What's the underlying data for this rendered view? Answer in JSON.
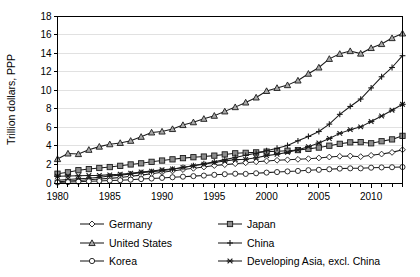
{
  "chart_data": {
    "type": "line",
    "title": "",
    "xlabel": "",
    "ylabel": "Trillion dollars, PPP",
    "xlim": [
      1980,
      2013
    ],
    "ylim": [
      0,
      18
    ],
    "ytick_step": 2,
    "yticks": [
      "0",
      "2",
      "4",
      "6",
      "8",
      "10",
      "12",
      "14",
      "16",
      "18"
    ],
    "xticks": [
      "1980",
      "1985",
      "1990",
      "1995",
      "2000",
      "2005",
      "2010"
    ],
    "xtick_values": [
      1980,
      1985,
      1990,
      1995,
      2000,
      2005,
      2010
    ],
    "minor_xticks_every": 1,
    "grid": "horizontal",
    "grid_color": "#d9d9d9",
    "legend_position": "bottom",
    "legend_columns": 2,
    "x": [
      1980,
      1981,
      1982,
      1983,
      1984,
      1985,
      1986,
      1987,
      1988,
      1989,
      1990,
      1991,
      1992,
      1993,
      1994,
      1995,
      1996,
      1997,
      1998,
      1999,
      2000,
      2001,
      2002,
      2003,
      2004,
      2005,
      2006,
      2007,
      2008,
      2009,
      2010,
      2011,
      2012,
      2013
    ],
    "series": [
      {
        "name": "Germany",
        "marker": "diamond-open",
        "color": "#1a1a1a",
        "values": [
          0.12,
          0.22,
          0.28,
          0.35,
          0.42,
          0.5,
          0.6,
          0.72,
          0.85,
          1.0,
          1.15,
          1.3,
          1.45,
          1.58,
          1.72,
          1.88,
          1.98,
          2.08,
          2.18,
          2.28,
          2.38,
          2.45,
          2.5,
          2.55,
          2.62,
          2.7,
          2.8,
          2.88,
          2.92,
          2.84,
          2.98,
          3.12,
          3.3,
          3.58
        ]
      },
      {
        "name": "Japan",
        "marker": "square-filled",
        "color": "#8c8c8c",
        "values": [
          1.0,
          1.15,
          1.38,
          1.5,
          1.62,
          1.72,
          1.85,
          2.0,
          2.12,
          2.28,
          2.42,
          2.55,
          2.68,
          2.78,
          2.85,
          2.95,
          3.08,
          3.2,
          3.25,
          3.3,
          3.38,
          3.42,
          3.48,
          3.55,
          3.68,
          3.82,
          4.02,
          4.22,
          4.38,
          4.4,
          4.28,
          4.5,
          4.7,
          5.08
        ]
      },
      {
        "name": "United States",
        "marker": "triangle-filled",
        "color": "#9e9e9e",
        "values": [
          2.58,
          3.18,
          3.12,
          3.58,
          3.92,
          4.18,
          4.32,
          4.55,
          4.98,
          5.45,
          5.55,
          5.82,
          6.25,
          6.55,
          6.92,
          7.25,
          7.72,
          8.18,
          8.68,
          9.22,
          9.92,
          10.25,
          10.55,
          11.05,
          11.78,
          12.45,
          13.38,
          13.92,
          14.22,
          13.95,
          14.55,
          14.98,
          15.62,
          16.12
        ]
      },
      {
        "name": "China",
        "marker": "plus",
        "color": "#1a1a1a",
        "values": [
          0.3,
          0.38,
          0.45,
          0.52,
          0.62,
          0.75,
          0.85,
          0.98,
          1.12,
          1.22,
          1.32,
          1.48,
          1.68,
          1.88,
          2.08,
          2.28,
          2.52,
          2.75,
          2.98,
          3.2,
          3.48,
          3.75,
          4.05,
          4.55,
          5.02,
          5.55,
          6.35,
          7.4,
          8.25,
          9.05,
          10.25,
          11.45,
          12.45,
          13.72
        ]
      },
      {
        "name": "Korea",
        "marker": "circle-open",
        "color": "#1a1a1a",
        "values": [
          0.06,
          0.1,
          0.14,
          0.18,
          0.22,
          0.26,
          0.3,
          0.36,
          0.42,
          0.48,
          0.55,
          0.62,
          0.68,
          0.74,
          0.8,
          0.88,
          0.95,
          1.0,
          0.98,
          1.05,
          1.12,
          1.18,
          1.25,
          1.3,
          1.38,
          1.42,
          1.48,
          1.55,
          1.58,
          1.58,
          1.65,
          1.68,
          1.7,
          1.72
        ]
      },
      {
        "name": "Developing Asia, excl. China",
        "marker": "cross",
        "color": "#1a1a1a",
        "values": [
          0.72,
          0.75,
          0.78,
          0.8,
          0.82,
          0.88,
          0.95,
          1.05,
          1.18,
          1.28,
          1.42,
          1.52,
          1.68,
          1.85,
          2.02,
          2.2,
          2.38,
          2.52,
          2.55,
          2.72,
          2.95,
          3.1,
          3.3,
          3.58,
          3.92,
          4.32,
          4.8,
          5.35,
          5.75,
          6.05,
          6.62,
          7.22,
          7.85,
          8.48
        ]
      }
    ]
  },
  "legend": {
    "items": [
      {
        "label": "Germany",
        "marker": "diamond-open"
      },
      {
        "label": "Japan",
        "marker": "square-filled"
      },
      {
        "label": "United States",
        "marker": "triangle-filled"
      },
      {
        "label": "China",
        "marker": "plus"
      },
      {
        "label": "Korea",
        "marker": "circle-open"
      },
      {
        "label": "Developing Asia, excl. China",
        "marker": "cross"
      }
    ]
  }
}
